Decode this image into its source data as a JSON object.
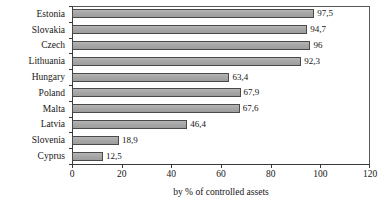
{
  "chart_data": {
    "type": "bar",
    "orientation": "horizontal",
    "title": "",
    "xlabel": "by % of controlled assets",
    "ylabel": "",
    "xlim": [
      0,
      120
    ],
    "xticks": [
      0,
      20,
      40,
      60,
      80,
      100,
      120
    ],
    "xtick_labels": [
      "0",
      "20",
      "40",
      "60",
      "80",
      "100",
      "120"
    ],
    "grid": false,
    "legend": false,
    "decimal_separator": ",",
    "bar_color": "#a8a8a8",
    "bar_border_color": "#4a4a4a",
    "categories": [
      "Estonia",
      "Slovakia",
      "Czech",
      "Lithuania",
      "Hungary",
      "Poland",
      "Malta",
      "Latvia",
      "Slovenia",
      "Cyprus"
    ],
    "values": [
      97.5,
      94.7,
      96,
      92.3,
      63.4,
      67.9,
      67.6,
      46.4,
      18.9,
      12.5
    ],
    "value_labels": [
      "97,5",
      "94,7",
      "96",
      "92,3",
      "63,4",
      "67,9",
      "67,6",
      "46,4",
      "18,9",
      "12,5"
    ]
  }
}
